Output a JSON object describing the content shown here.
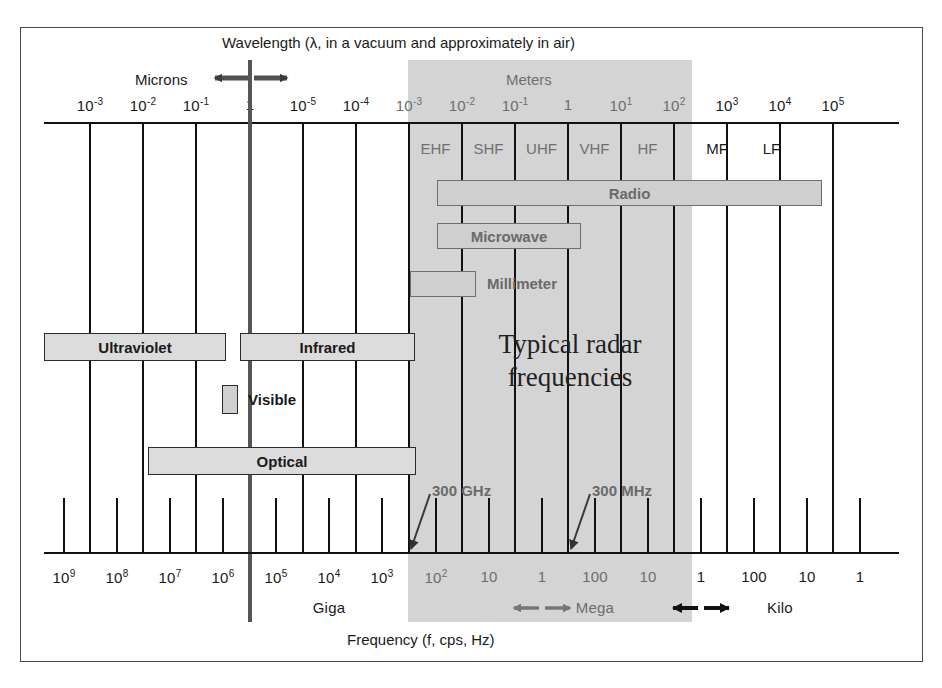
{
  "figure": {
    "top_axis_title": "Wavelength (λ, in a vacuum and approximately in air)",
    "bottom_axis_title": "Frequency (f, cps, Hz)",
    "unit_left": "Microns",
    "unit_right": "Meters",
    "radar_line1": "Typical radar",
    "radar_line2": "frequencies",
    "shade_color": "#d4d4d4",
    "bar_fill": "#dcdcdc",
    "line_color": "#111111"
  },
  "chart_data": {
    "type": "table",
    "xlabel": "Frequency (f, cps, Hz)",
    "x2label": "Wavelength (λ, in a vacuum and approximately in air)",
    "grid": true,
    "legend": "none",
    "wavelength_ticks": [
      {
        "label": "10",
        "exp": "-3",
        "unit": "Microns",
        "x": 90,
        "shaded": false
      },
      {
        "label": "10",
        "exp": "-2",
        "unit": "Microns",
        "x": 143,
        "shaded": false
      },
      {
        "label": "10",
        "exp": "-1",
        "unit": "Microns",
        "x": 196,
        "shaded": false
      },
      {
        "label": "1",
        "exp": "",
        "unit": "Microns",
        "x": 250,
        "shaded": false
      },
      {
        "label": "10",
        "exp": "-5",
        "unit": "Meters",
        "x": 303,
        "shaded": false
      },
      {
        "label": "10",
        "exp": "-4",
        "unit": "Meters",
        "x": 356,
        "shaded": false
      },
      {
        "label": "10",
        "exp": "-3",
        "unit": "Meters",
        "x": 409,
        "shaded": true
      },
      {
        "label": "10",
        "exp": "-2",
        "unit": "Meters",
        "x": 462,
        "shaded": true
      },
      {
        "label": "10",
        "exp": "-1",
        "unit": "Meters",
        "x": 515,
        "shaded": true
      },
      {
        "label": "1",
        "exp": "",
        "unit": "Meters",
        "x": 568,
        "shaded": true
      },
      {
        "label": "10",
        "exp": "1",
        "unit": "Meters",
        "x": 621,
        "shaded": true
      },
      {
        "label": "10",
        "exp": "2",
        "unit": "Meters",
        "x": 674,
        "shaded": true
      },
      {
        "label": "10",
        "exp": "3",
        "unit": "Meters",
        "x": 727,
        "shaded": false
      },
      {
        "label": "10",
        "exp": "4",
        "unit": "Meters",
        "x": 780,
        "shaded": false
      },
      {
        "label": "10",
        "exp": "5",
        "unit": "Meters",
        "x": 833,
        "shaded": false
      }
    ],
    "frequency_ticks": [
      {
        "label": "10",
        "exp": "9",
        "prefix": "Giga",
        "x": 64,
        "shaded": false
      },
      {
        "label": "10",
        "exp": "8",
        "prefix": "Giga",
        "x": 117,
        "shaded": false
      },
      {
        "label": "10",
        "exp": "7",
        "prefix": "Giga",
        "x": 170,
        "shaded": false
      },
      {
        "label": "10",
        "exp": "6",
        "prefix": "Giga",
        "x": 223,
        "shaded": false
      },
      {
        "label": "10",
        "exp": "5",
        "prefix": "Giga",
        "x": 276,
        "shaded": false
      },
      {
        "label": "10",
        "exp": "4",
        "prefix": "Giga",
        "x": 329,
        "shaded": false
      },
      {
        "label": "10",
        "exp": "3",
        "prefix": "Giga",
        "x": 382,
        "shaded": false
      },
      {
        "label": "10",
        "exp": "2",
        "prefix": "Mega",
        "x": 436,
        "shaded": true
      },
      {
        "label": "10",
        "exp": "",
        "prefix": "Mega",
        "x": 489,
        "shaded": true
      },
      {
        "label": "1",
        "exp": "",
        "prefix": "Mega",
        "x": 542,
        "shaded": true
      },
      {
        "label": "100",
        "exp": "",
        "prefix": "Mega",
        "x": 595,
        "shaded": true
      },
      {
        "label": "10",
        "exp": "",
        "prefix": "Mega",
        "x": 648,
        "shaded": true
      },
      {
        "label": "1",
        "exp": "",
        "prefix": "Kilo",
        "x": 701,
        "shaded": false
      },
      {
        "label": "100",
        "exp": "",
        "prefix": "Kilo",
        "x": 754,
        "shaded": false
      },
      {
        "label": "10",
        "exp": "",
        "prefix": "Kilo",
        "x": 807,
        "shaded": false
      },
      {
        "label": "1",
        "exp": "",
        "prefix": "Kilo",
        "x": 860,
        "shaded": false
      }
    ],
    "prefix_labels": [
      {
        "text": "Giga",
        "x": 329,
        "dim": false
      },
      {
        "text": "Mega",
        "x": 595,
        "dim": true
      },
      {
        "text": "Kilo",
        "x": 780,
        "dim": false
      }
    ],
    "radio_bands": [
      {
        "label": "EHF",
        "x": 409,
        "w": 53,
        "dim": true
      },
      {
        "label": "SHF",
        "x": 462,
        "w": 53,
        "dim": true
      },
      {
        "label": "UHF",
        "x": 515,
        "w": 53,
        "dim": true
      },
      {
        "label": "VHF",
        "x": 568,
        "w": 53,
        "dim": true
      },
      {
        "label": "HF",
        "x": 621,
        "w": 53,
        "dim": true
      },
      {
        "label": "MF",
        "x": 692,
        "w": 50,
        "dim": false
      },
      {
        "label": "LF",
        "x": 745,
        "w": 53,
        "dim": false
      }
    ],
    "spectrum_bars": [
      {
        "label": "Radio",
        "x": 437,
        "w": 385,
        "y": 180,
        "h": 26,
        "dim": true
      },
      {
        "label": "Microwave",
        "x": 437,
        "w": 144,
        "y": 223,
        "h": 26,
        "dim": true
      },
      {
        "label": "Millimeter",
        "x": 410,
        "w": 66,
        "y": 271,
        "h": 26,
        "dim": true,
        "label_outside": "Millimeter",
        "label_x": 487
      },
      {
        "label": "Ultraviolet",
        "x": 44,
        "w": 182,
        "y": 333,
        "h": 28,
        "dim": false
      },
      {
        "label": "Infrared",
        "x": 240,
        "w": 175,
        "y": 333,
        "h": 28,
        "dim": false
      },
      {
        "label": "Visible",
        "x": 222,
        "w": 16,
        "y": 385,
        "h": 29,
        "dim": false,
        "label_outside": "Visible",
        "label_x": 248
      },
      {
        "label": "Optical",
        "x": 148,
        "w": 268,
        "y": 447,
        "h": 28,
        "dim": false
      }
    ],
    "annotations": [
      {
        "text": "300 GHz",
        "label_x": 432,
        "label_y": 482,
        "arrow_from_x": 432,
        "arrow_from_y": 496,
        "arrow_to_x": 410,
        "arrow_to_y": 552
      },
      {
        "text": "300 MHz",
        "label_x": 592,
        "label_y": 482,
        "arrow_from_x": 592,
        "arrow_from_y": 496,
        "arrow_to_x": 570,
        "arrow_to_y": 552
      }
    ]
  }
}
